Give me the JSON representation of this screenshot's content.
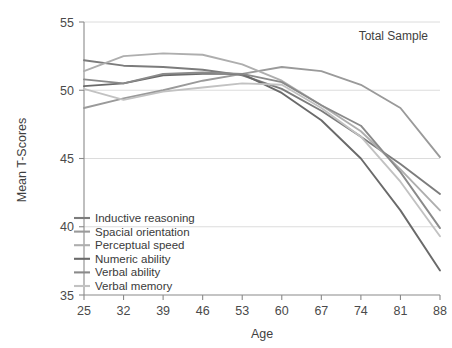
{
  "annotation": {
    "total_sample_label": "Total Sample"
  },
  "axes": {
    "x_title": "Age",
    "y_title": "Mean T-Scores",
    "x_ticks": [
      "25",
      "32",
      "39",
      "46",
      "53",
      "60",
      "67",
      "74",
      "81",
      "88"
    ],
    "y_ticks": [
      "35",
      "40",
      "45",
      "50",
      "55"
    ]
  },
  "legend": {
    "items": [
      {
        "label": "Inductive reasoning",
        "color": "#7c7c7c"
      },
      {
        "label": "Spacial orientation",
        "color": "#9a9a9a"
      },
      {
        "label": "Perceptual speed",
        "color": "#aeaeae"
      },
      {
        "label": "Numeric ability",
        "color": "#6a6a6a"
      },
      {
        "label": "Verbal ability",
        "color": "#8a8a8a"
      },
      {
        "label": "Verbal memory",
        "color": "#c2c2c2"
      }
    ]
  },
  "chart_data": {
    "type": "line",
    "title": "",
    "subtitle": "Total Sample",
    "xlabel": "Age",
    "ylabel": "Mean T-Scores",
    "x": [
      25,
      32,
      39,
      46,
      53,
      60,
      67,
      74,
      81,
      88
    ],
    "xlim": [
      25,
      88
    ],
    "ylim": [
      35,
      55
    ],
    "grid": "horizontal",
    "legend_position": "inner-bottom-left",
    "series": [
      {
        "name": "Inductive reasoning",
        "color": "#7c7c7c",
        "values": [
          52.2,
          51.8,
          51.7,
          51.5,
          51.1,
          50.1,
          48.5,
          46.6,
          44.6,
          42.4
        ]
      },
      {
        "name": "Spacial orientation",
        "color": "#9a9a9a",
        "values": [
          48.7,
          49.4,
          50.0,
          50.7,
          51.2,
          51.7,
          51.4,
          50.4,
          48.7,
          45.1
        ]
      },
      {
        "name": "Perceptual speed",
        "color": "#aeaeae",
        "values": [
          51.4,
          52.5,
          52.7,
          52.6,
          51.9,
          50.7,
          48.9,
          47.0,
          44.2,
          41.2
        ]
      },
      {
        "name": "Numeric ability",
        "color": "#6a6a6a",
        "values": [
          50.3,
          50.5,
          51.1,
          51.2,
          51.2,
          49.8,
          47.8,
          45.0,
          41.2,
          36.8
        ]
      },
      {
        "name": "Verbal ability",
        "color": "#8a8a8a",
        "values": [
          50.8,
          50.5,
          51.2,
          51.3,
          51.2,
          50.6,
          48.9,
          47.4,
          44.0,
          39.9
        ]
      },
      {
        "name": "Verbal memory",
        "color": "#c2c2c2",
        "values": [
          50.1,
          49.3,
          49.9,
          50.2,
          50.5,
          50.4,
          48.7,
          46.6,
          43.3,
          39.3
        ]
      }
    ]
  }
}
